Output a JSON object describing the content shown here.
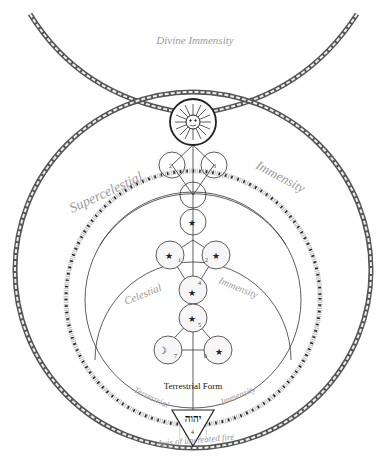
{
  "diagram": {
    "labels": {
      "divine_immensity": "Divine Immensity",
      "supercelestial": "Supercelestial",
      "supercelestial_immensity": "Immensity",
      "celestial": "Celestial",
      "celestial_immensity": "Immensity",
      "terrestrial": "Terrestrial",
      "terrestrial_immensity": "Immensity",
      "terrestrial_form": "Terrestrial Form",
      "axis": "Axis of uncreated fire",
      "tetragrammaton": "יהוה"
    },
    "sun_symbol": "sun-face-icon",
    "nodes": [
      {
        "id": "crown",
        "label": "",
        "symbol": "sun"
      },
      {
        "id": "left-upper",
        "number": "2",
        "symbol": "none"
      },
      {
        "id": "right-upper",
        "number": "3",
        "symbol": "none"
      },
      {
        "id": "center-upper",
        "number": "",
        "symbol": "none"
      },
      {
        "id": "center-star",
        "number": "",
        "symbol": "★"
      },
      {
        "id": "left-middle",
        "number": "1",
        "symbol": "★"
      },
      {
        "id": "right-middle",
        "number": "2",
        "symbol": "★"
      },
      {
        "id": "center-4",
        "number": "4",
        "symbol": "★"
      },
      {
        "id": "center-5",
        "number": "5",
        "symbol": "★"
      },
      {
        "id": "left-lower",
        "number": "7",
        "symbol": "☽"
      },
      {
        "id": "right-lower",
        "number": "6",
        "symbol": "★"
      }
    ],
    "colors": {
      "line": "#333333",
      "label": "#9a9a9a",
      "chain": "#555555",
      "background": "#ffffff"
    }
  }
}
